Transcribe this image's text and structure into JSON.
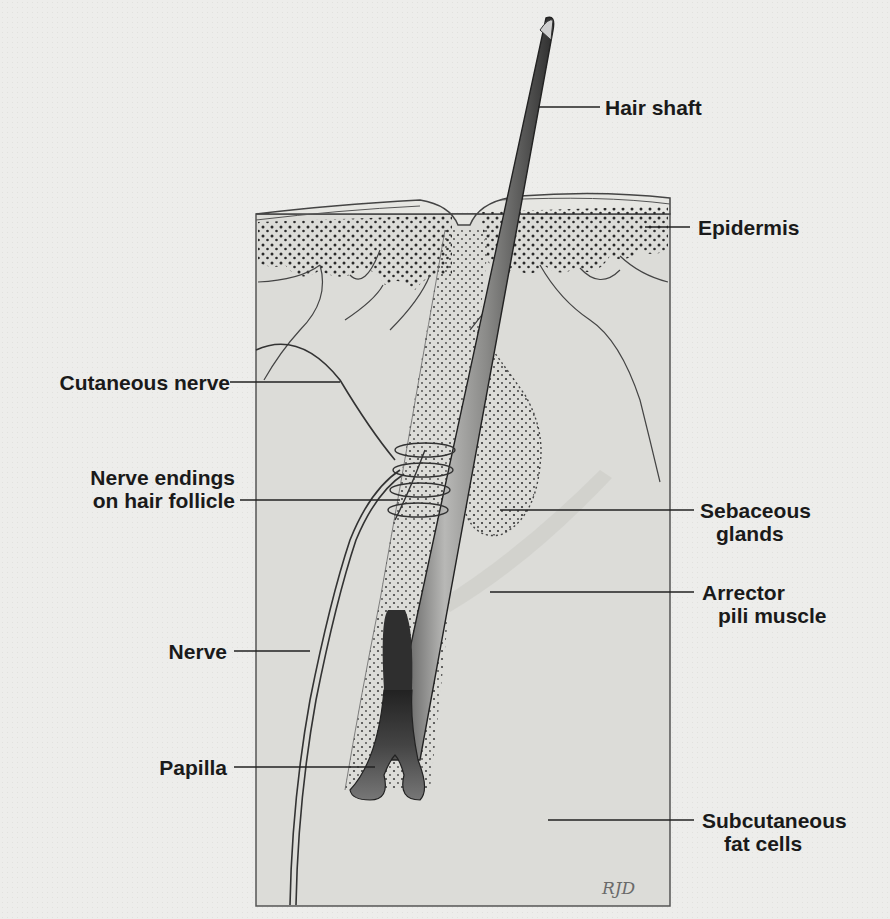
{
  "diagram": {
    "signature": "RJD",
    "labels_left": [
      {
        "id": "cutaneous-nerve",
        "lines": [
          "Cutaneous nerve"
        ]
      },
      {
        "id": "nerve-endings",
        "lines": [
          "Nerve endings",
          "on hair follicle"
        ]
      },
      {
        "id": "nerve",
        "lines": [
          "Nerve"
        ]
      },
      {
        "id": "papilla",
        "lines": [
          "Papilla"
        ]
      }
    ],
    "labels_right": [
      {
        "id": "hair-shaft",
        "lines": [
          "Hair shaft"
        ]
      },
      {
        "id": "epidermis",
        "lines": [
          "Epidermis"
        ]
      },
      {
        "id": "sebaceous-glands",
        "lines": [
          "Sebaceous",
          "glands"
        ]
      },
      {
        "id": "arrector-pili",
        "lines": [
          "Arrector",
          "pili muscle"
        ]
      },
      {
        "id": "subcutaneous-fat",
        "lines": [
          "Subcutaneous",
          "fat cells"
        ]
      }
    ],
    "colors": {
      "paper": "#ededeb",
      "tissue": "#dcdcd8",
      "ink": "#1a1a1a",
      "hair_shade": "#6e6e6e",
      "bulb": "#3a3a3a"
    }
  }
}
